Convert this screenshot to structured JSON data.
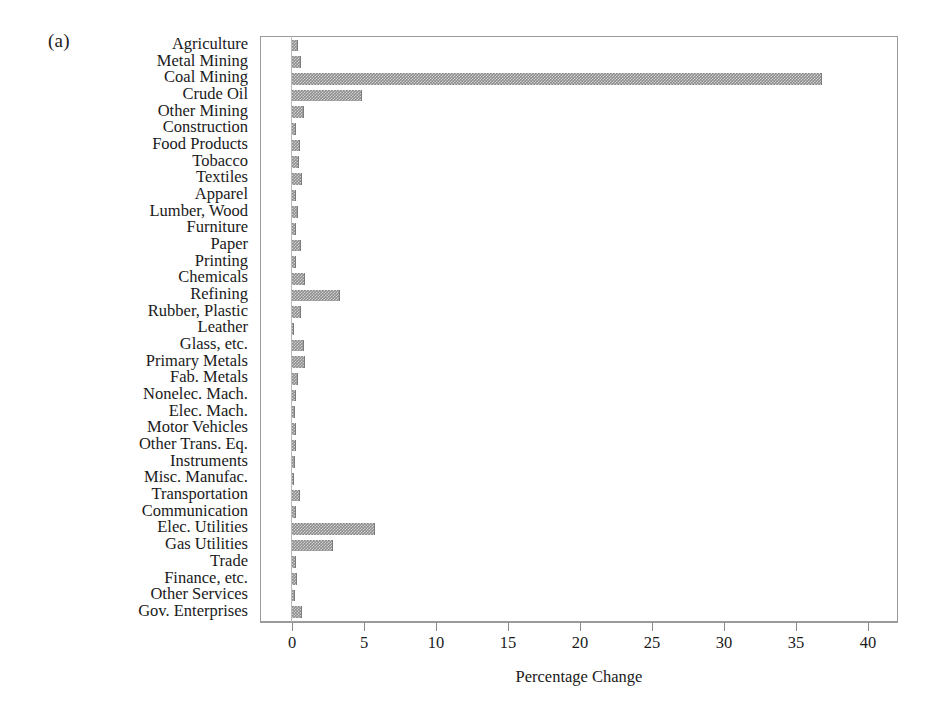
{
  "figure": {
    "panel_label": "(a)",
    "background_color": "#ffffff",
    "bar_color": "#8d8d8d",
    "axis_color": "#9a9a9a",
    "text_color": "#1a1a1a"
  },
  "chart_data": {
    "type": "bar",
    "orientation": "horizontal",
    "title": "",
    "subtitle": "",
    "xlabel": "Percentage Change",
    "ylabel": "",
    "xlim": [
      0,
      42.2
    ],
    "ylim": null,
    "grid": false,
    "legend": null,
    "xticks": [
      0,
      5,
      10,
      15,
      20,
      25,
      30,
      35,
      40
    ],
    "xtick_labels": [
      "0",
      "5",
      "10",
      "15",
      "20",
      "25",
      "30",
      "35",
      "40"
    ],
    "categories": [
      "Agriculture",
      "Metal Mining",
      "Coal Mining",
      "Crude Oil",
      "Other Mining",
      "Construction",
      "Food Products",
      "Tobacco",
      "Textiles",
      "Apparel",
      "Lumber, Wood",
      "Furniture",
      "Paper",
      "Printing",
      "Chemicals",
      "Refining",
      "Rubber, Plastic",
      "Leather",
      "Glass, etc.",
      "Primary Metals",
      "Fab. Metals",
      "Nonelec. Mach.",
      "Elec. Mach.",
      "Motor Vehicles",
      "Other Trans. Eq.",
      "Instruments",
      "Misc. Manufac.",
      "Transportation",
      "Communication",
      "Elec. Utilities",
      "Gas Utilities",
      "Trade",
      "Finance, etc.",
      "Other Services",
      "Gov. Enterprises"
    ],
    "values": [
      0.45,
      0.6,
      36.8,
      4.85,
      0.85,
      0.3,
      0.55,
      0.5,
      0.7,
      0.25,
      0.4,
      0.25,
      0.6,
      0.25,
      0.9,
      3.35,
      0.65,
      0.12,
      0.85,
      0.9,
      0.45,
      0.3,
      0.22,
      0.25,
      0.3,
      0.18,
      0.15,
      0.55,
      0.25,
      5.75,
      2.85,
      0.25,
      0.35,
      0.2,
      0.7
    ]
  },
  "axis": {
    "x_title": "Percentage Change"
  }
}
